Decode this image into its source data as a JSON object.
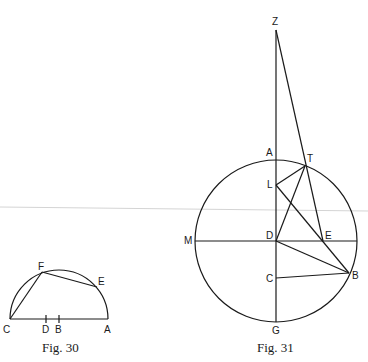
{
  "figures": [
    {
      "caption": "Fig. 30",
      "type": "semicircle construction",
      "points": {
        "C": {
          "label": "C",
          "x": 10,
          "y": 319
        },
        "D": {
          "label": "D",
          "x": 46,
          "y": 319
        },
        "B": {
          "label": "B",
          "x": 59,
          "y": 319
        },
        "A": {
          "label": "A",
          "x": 108,
          "y": 319
        },
        "F": {
          "label": "F",
          "x": 42,
          "y": 272
        },
        "E": {
          "label": "E",
          "x": 97,
          "y": 287
        }
      },
      "segments": [
        "C-A",
        "C-F",
        "F-E"
      ],
      "arcs": [
        "semicircle over CA",
        "chord arc C-F"
      ]
    },
    {
      "caption": "Fig. 31",
      "type": "circle construction",
      "points": {
        "Z": {
          "label": "Z",
          "x": 276,
          "y": 30
        },
        "A": {
          "label": "A",
          "x": 276,
          "y": 160
        },
        "T": {
          "label": "T",
          "x": 305,
          "y": 166
        },
        "L": {
          "label": "L",
          "x": 276,
          "y": 185
        },
        "M": {
          "label": "M",
          "x": 196,
          "y": 241
        },
        "D": {
          "label": "D",
          "x": 276,
          "y": 241
        },
        "E": {
          "label": "E",
          "x": 323,
          "y": 241
        },
        "B": {
          "label": "B",
          "x": 349,
          "y": 273
        },
        "C": {
          "label": "C",
          "x": 276,
          "y": 278
        },
        "G": {
          "label": "G",
          "x": 276,
          "y": 321
        }
      },
      "circle": {
        "center": "D",
        "cx": 276,
        "cy": 241,
        "r": 81
      },
      "segments": [
        "Z-G",
        "M-diameter",
        "Z-E",
        "L-T",
        "T-D",
        "L-B",
        "D-B",
        "C-B",
        "T-E"
      ]
    }
  ]
}
